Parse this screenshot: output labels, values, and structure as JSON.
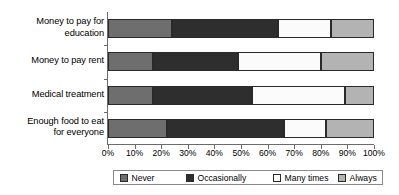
{
  "chart_data": {
    "type": "bar",
    "orientation": "horizontal",
    "stacked": true,
    "stack_mode": "percent",
    "title": "",
    "xlabel": "",
    "ylabel": "",
    "xlim": [
      0,
      100
    ],
    "grid": false,
    "legend_position": "bottom",
    "categories": [
      "Money to pay for education",
      "Money to pay rent",
      "Medical treatment",
      "Enough food to eat for everyone"
    ],
    "category_lines": [
      [
        "Money to pay for",
        "education"
      ],
      [
        "Money to pay rent"
      ],
      [
        "Medical treatment"
      ],
      [
        "Enough food to eat",
        "for everyone"
      ]
    ],
    "xticks": [
      0,
      10,
      20,
      30,
      40,
      50,
      60,
      70,
      80,
      90,
      100
    ],
    "xticklabels": [
      "0%",
      "10%",
      "20%",
      "30%",
      "40%",
      "50%",
      "60%",
      "70%",
      "80%",
      "90%",
      "100%"
    ],
    "series": [
      {
        "name": "Never",
        "color": "#6e6e6e",
        "values": [
          24,
          17,
          17,
          22
        ]
      },
      {
        "name": "Occasionally",
        "color": "#2e2e2e",
        "values": [
          40,
          32,
          37,
          44
        ]
      },
      {
        "name": "Many times",
        "color": "#fbfbfb",
        "values": [
          20,
          31,
          35,
          16
        ]
      },
      {
        "name": "Always",
        "color": "#b3b3b3",
        "values": [
          16,
          20,
          11,
          18
        ]
      }
    ]
  },
  "legend": {
    "items": [
      {
        "label": "Never"
      },
      {
        "label": "Occasionally"
      },
      {
        "label": "Many times"
      },
      {
        "label": "Always"
      }
    ]
  }
}
